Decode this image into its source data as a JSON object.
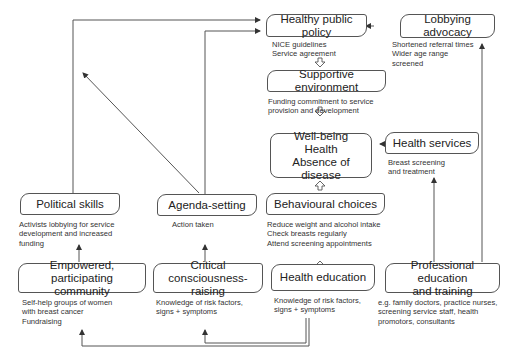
{
  "diagram": {
    "boxes": {
      "healthy_public_policy": {
        "label": "Healthy public policy",
        "note": "NICE guidelines\nService agreement"
      },
      "lobbying_advocacy": {
        "label": "Lobbying advocacy",
        "note": "Shortened referral times\nWider age range\nscreened"
      },
      "supportive_environment": {
        "label": "Supportive environment",
        "note": "Funding commitment to service\nprovision and development"
      },
      "well_being": {
        "label": "Well-being\nHealth\nAbsence of disease"
      },
      "health_services": {
        "label": "Health services",
        "note": "Breast screening\nand treatment"
      },
      "behavioural_choices": {
        "label": "Behavioural choices",
        "note": "Reduce weight and alcohol intake\nCheck breasts regularly\nAttend screening appointments"
      },
      "political_skills": {
        "label": "Political skills",
        "note": "Activists lobbying for service\ndevelopment and increased\nfunding"
      },
      "agenda_setting": {
        "label": "Agenda-setting",
        "note": "Action taken"
      },
      "empowered_community": {
        "label": "Empowered, participating\ncommunity",
        "note": "Self-help groups of women\nwith breast cancer\nFundraising"
      },
      "critical_consciousness": {
        "label": "Critical\nconsciousness-raising",
        "note": "Knowledge of risk factors,\nsigns + symptoms"
      },
      "health_education": {
        "label": "Health education",
        "note": "Knowledge of risk factors,\nsigns + symptoms"
      },
      "professional_education": {
        "label": "Professional education\nand training",
        "note": "e.g. family doctors, practice nurses,\nscreening service staff, health\npromotors, consultants"
      }
    },
    "colors": {
      "line": "#555555",
      "text": "#222222"
    }
  }
}
